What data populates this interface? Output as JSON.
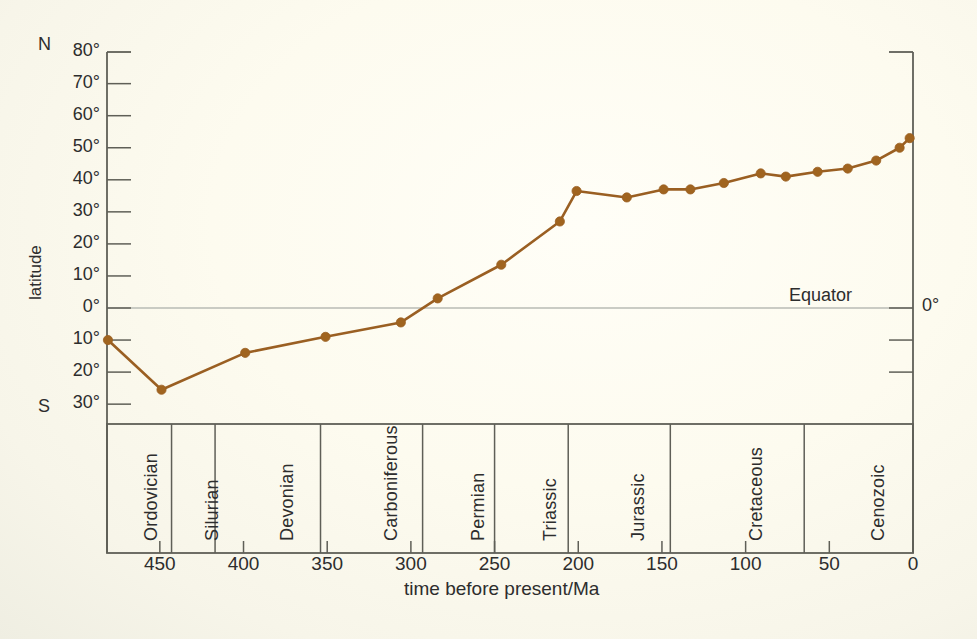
{
  "chart_data": {
    "type": "line",
    "title": "",
    "subtitle": "",
    "xlabel": "time before present/Ma",
    "ylabel": "latitude",
    "xlim": [
      490,
      0
    ],
    "ylim": [
      -35,
      80
    ],
    "x_reversed": true,
    "grid": false,
    "legend": "none",
    "series_color": "#9a5f22",
    "marker_color": "#a0641f",
    "annotations": [
      {
        "name": "equator-line",
        "y": 0,
        "label": "Equator",
        "label_x": 430
      },
      {
        "name": "north-marker",
        "label": "N"
      },
      {
        "name": "south-marker",
        "label": "S"
      },
      {
        "name": "right-axis-zero",
        "label": "0°"
      }
    ],
    "xticks": [
      450,
      400,
      350,
      300,
      250,
      200,
      150,
      100,
      50,
      0
    ],
    "xtick_labels": [
      "450",
      "400",
      "350",
      "300",
      "250",
      "200",
      "150",
      "100",
      "50",
      "0"
    ],
    "yticks": [
      80,
      70,
      60,
      50,
      40,
      30,
      20,
      10,
      0,
      -10,
      -20,
      -30
    ],
    "ytick_labels": [
      "80°",
      "70°",
      "60°",
      "50°",
      "40°",
      "30°",
      "20°",
      "10°",
      "0°",
      "10°",
      "20°",
      "30°"
    ],
    "series": [
      {
        "name": "palaeolatitude",
        "x": [
          481,
          449,
          399,
          351,
          306,
          284,
          246,
          211,
          201,
          171,
          149,
          133,
          113,
          91,
          76,
          57,
          39,
          22,
          8,
          2
        ],
        "y": [
          -10,
          -25.5,
          -14,
          -9,
          -4.5,
          3,
          13.5,
          27,
          36.5,
          34.5,
          37,
          37,
          39,
          42,
          41,
          42.5,
          43.5,
          46,
          50,
          53
        ]
      }
    ],
    "periods": [
      {
        "label": "Ordovician",
        "start": 490,
        "end": 443
      },
      {
        "label": "Silurian",
        "start": 443,
        "end": 417
      },
      {
        "label": "Devonian",
        "start": 417,
        "end": 354
      },
      {
        "label": "Carboniferous",
        "start": 354,
        "end": 293
      },
      {
        "label": "Permian",
        "start": 293,
        "end": 250
      },
      {
        "label": "Triassic",
        "start": 250,
        "end": 206
      },
      {
        "label": "Jurassic",
        "start": 206,
        "end": 145
      },
      {
        "label": "Cretaceous",
        "start": 145,
        "end": 65
      },
      {
        "label": "Cenozoic",
        "start": 65,
        "end": 0
      }
    ]
  },
  "axes": {
    "hemisphere_north": "N",
    "hemisphere_south": "S"
  },
  "colors": {
    "curve": "#9a5f22",
    "marker": "#a0641f",
    "axis": "#5f5f57",
    "equator": "#b9bbb4",
    "background": "#fdfcf4",
    "text": "#2d2d2d"
  }
}
